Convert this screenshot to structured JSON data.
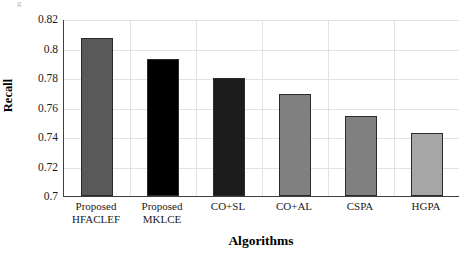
{
  "chart_data": {
    "type": "bar",
    "title": "",
    "xlabel": "Algorithms",
    "ylabel": "Recall",
    "categories": [
      "Proposed\nHFACLEF",
      "Proposed\nMKLCE",
      "CO+SL",
      "CO+AL",
      "CSPA",
      "HGPA"
    ],
    "category_lines": [
      [
        "Proposed",
        "HFACLEF"
      ],
      [
        "Proposed",
        "MKLCE"
      ],
      [
        "CO+SL",
        ""
      ],
      [
        "CO+AL",
        ""
      ],
      [
        "CSPA",
        ""
      ],
      [
        "HGPA",
        ""
      ]
    ],
    "values": [
      0.807,
      0.793,
      0.78,
      0.769,
      0.754,
      0.743
    ],
    "bar_colors": [
      "#595959",
      "#000000",
      "#1c1c1c",
      "#808080",
      "#808080",
      "#a6a6a6"
    ],
    "ylim": [
      0.7,
      0.82
    ],
    "yticks": [
      0.82,
      0.8,
      0.78,
      0.76,
      0.74,
      0.72,
      0.7
    ],
    "ytick_labels": [
      "0.82",
      "0.8",
      "0.78",
      "0.76",
      "0.74",
      "0.72",
      "0.7"
    ],
    "grid": true,
    "grid_color": "#e2e2e2",
    "legend": "none",
    "axis_color": "#3f3f3f",
    "bar_edge_color": "#2b2b2b"
  },
  "artifact": {
    "corner_mark": "g"
  }
}
